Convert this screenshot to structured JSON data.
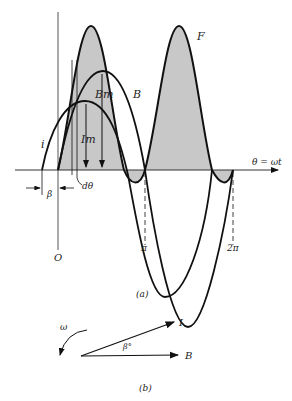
{
  "figure_a": {
    "caption": "(a)",
    "axis_label": "θ = ωt",
    "origin_label": "O",
    "curve_labels": {
      "F": "F",
      "B": "B",
      "I": "i"
    },
    "amplitude_labels": {
      "Bm": "Bm",
      "Im": "Im"
    },
    "dtheta_label": "dθ",
    "beta_label": "β",
    "tick_labels": {
      "pi": "π",
      "two_pi": "2π"
    },
    "colors": {
      "stroke": "#111111",
      "fill": "#c8c8c8"
    }
  },
  "figure_b": {
    "caption": "(b)",
    "omega_label": "ω",
    "vector_I_label": "I",
    "vector_B_label": "B",
    "angle_label": "β°"
  }
}
